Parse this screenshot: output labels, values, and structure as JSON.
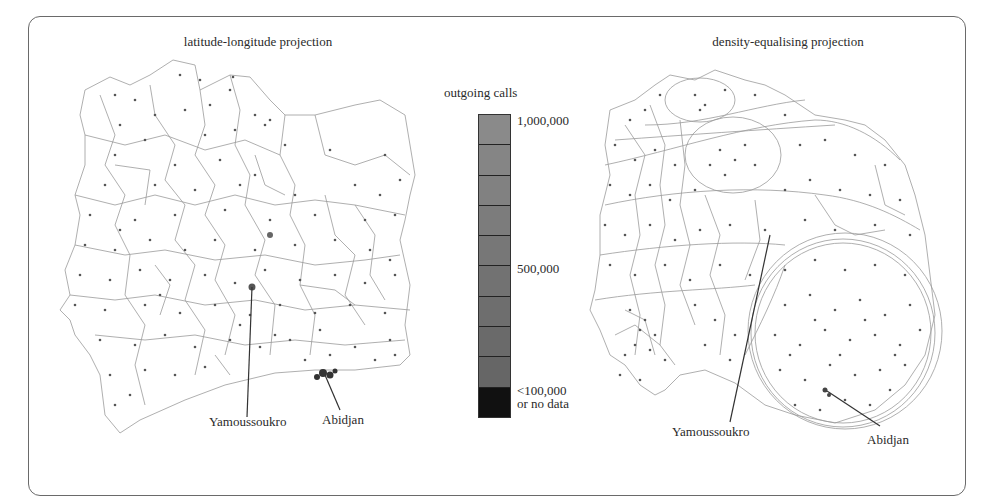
{
  "figure": {
    "left_panel": {
      "title": "latitude-longitude projection",
      "labels": {
        "city1": "Yamoussoukro",
        "city2": "Abidjan"
      }
    },
    "right_panel": {
      "title": "density-equalising projection",
      "labels": {
        "city1": "Yamoussoukro",
        "city2": "Abidjan"
      }
    },
    "legend": {
      "title": "outgoing calls",
      "max_label": "1,000,000",
      "mid_label": "500,000",
      "min_label_line1": "<100,000",
      "min_label_line2": "or no data",
      "segments": [
        {
          "color": "#8a8a8a"
        },
        {
          "color": "#858585"
        },
        {
          "color": "#818181"
        },
        {
          "color": "#7c7c7c"
        },
        {
          "color": "#777777"
        },
        {
          "color": "#727272"
        },
        {
          "color": "#6e6e6e"
        },
        {
          "color": "#6a6a6a"
        },
        {
          "color": "#666666"
        },
        {
          "color": "#111111"
        }
      ]
    },
    "colors": {
      "border": "#6a6a6a",
      "boundary_line": "#9a9a9a",
      "dot": "#555555",
      "city_cluster": "#444444"
    }
  }
}
